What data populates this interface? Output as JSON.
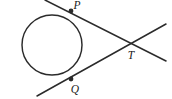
{
  "figure": {
    "width": 172,
    "height": 99,
    "background_color": "#ffffff",
    "stroke_color": "#2b2b2b",
    "label_color": "#1a1a1a"
  },
  "labels": {
    "p": "P",
    "q": "Q",
    "t": "T"
  },
  "chart_data": {
    "type": "diagram",
    "shapes": [
      {
        "kind": "circle",
        "name": "main-circle",
        "cx": 52,
        "cy": 45,
        "r": 30
      },
      {
        "kind": "line",
        "name": "secant-through-p",
        "x1": 45,
        "y1": 0,
        "x2": 166,
        "y2": 61,
        "passes_through": [
          "P",
          "T"
        ]
      },
      {
        "kind": "line",
        "name": "secant-through-q",
        "x1": 37,
        "y1": 96,
        "x2": 166,
        "y2": 24,
        "passes_through": [
          "Q",
          "T"
        ]
      }
    ],
    "points": [
      {
        "label": "P",
        "x": 71,
        "y": 11,
        "marker": "filled-dot",
        "on": "circle",
        "label_x": 77,
        "label_y": 9
      },
      {
        "label": "Q",
        "x": 71,
        "y": 79,
        "marker": "filled-dot",
        "on": "circle",
        "label_x": 75,
        "label_y": 93
      },
      {
        "label": "T",
        "x": 131,
        "y": 42,
        "marker": "none",
        "on": "intersection",
        "label_x": 131,
        "label_y": 59
      }
    ],
    "xlabel": "",
    "ylabel": "",
    "legend": []
  }
}
